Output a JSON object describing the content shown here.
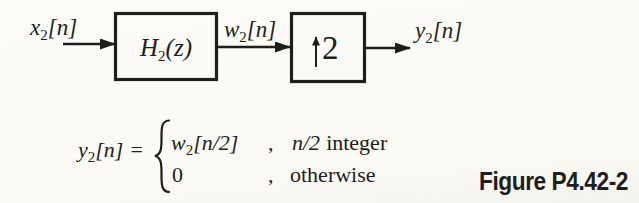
{
  "figure": {
    "caption": "Figure P4.42-2"
  },
  "colors": {
    "ink": "#201e1b",
    "background": "#fbfaf6"
  },
  "diagram": {
    "input_label": {
      "base": "x",
      "sub": "2",
      "suffix": "[n]"
    },
    "filter_block": {
      "base": "H",
      "sub": "2",
      "suffix": "(z)"
    },
    "intermediate_label": {
      "base": "w",
      "sub": "2",
      "suffix": "[n]"
    },
    "upsampler_block": {
      "icon": "up-arrow",
      "factor": "2"
    },
    "output_label": {
      "base": "y",
      "sub": "2",
      "suffix": "[n]"
    }
  },
  "equation": {
    "lhs": {
      "base": "y",
      "sub": "2",
      "suffix": "[n]",
      "equals": "="
    },
    "cases": [
      {
        "value": {
          "base": "w",
          "sub": "2",
          "suffix": "[n/2]"
        },
        "separator": ",",
        "condition_math": "n/2",
        "condition_text": "integer"
      },
      {
        "value": {
          "base": "0",
          "sub": "",
          "suffix": ""
        },
        "separator": ",",
        "condition_math": "",
        "condition_text": "otherwise"
      }
    ]
  }
}
